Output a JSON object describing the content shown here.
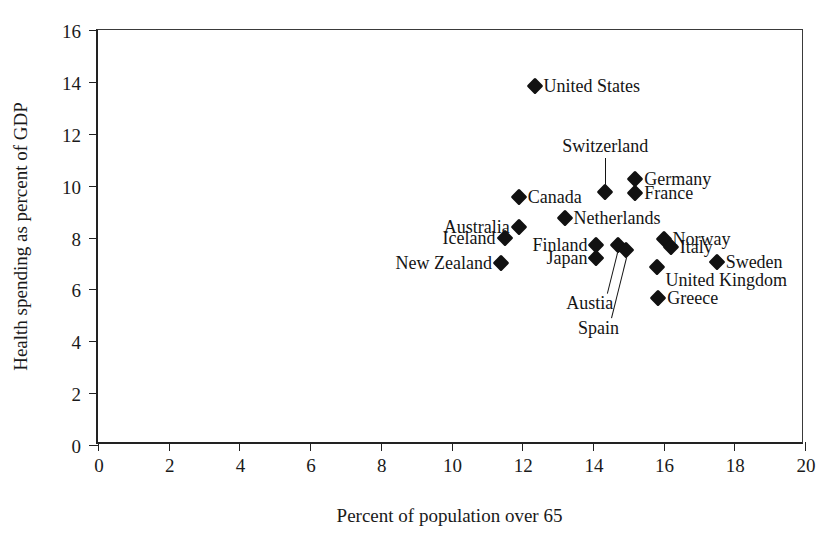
{
  "chart_data": {
    "type": "scatter",
    "title": "",
    "xlabel": "Percent of population over 65",
    "ylabel": "Health spending as percent of GDP",
    "xlim": [
      0,
      20
    ],
    "ylim": [
      0,
      16
    ],
    "xticks": [
      "0",
      "2",
      "4",
      "6",
      "8",
      "10",
      "12",
      "14",
      "16",
      "18",
      "20"
    ],
    "yticks": [
      "0",
      "2",
      "4",
      "6",
      "8",
      "10",
      "12",
      "14",
      "16"
    ],
    "grid": false,
    "legend": "none",
    "marker": "filled-diamond",
    "marker_color": "#111111",
    "points": [
      {
        "name": "United States",
        "x": 12.35,
        "y": 13.85,
        "label_pos": "right"
      },
      {
        "name": "Switzerland",
        "x": 14.35,
        "y": 9.75,
        "label_pos": "leader-up"
      },
      {
        "name": "Germany",
        "x": 15.2,
        "y": 10.25,
        "label_pos": "right"
      },
      {
        "name": "France",
        "x": 15.2,
        "y": 9.7,
        "label_pos": "right"
      },
      {
        "name": "Canada",
        "x": 11.9,
        "y": 9.55,
        "label_pos": "right"
      },
      {
        "name": "Australia",
        "x": 11.9,
        "y": 8.4,
        "label_pos": "left"
      },
      {
        "name": "Iceland",
        "x": 11.5,
        "y": 8.0,
        "label_pos": "left"
      },
      {
        "name": "New Zealand",
        "x": 11.4,
        "y": 7.0,
        "label_pos": "left"
      },
      {
        "name": "Netherlands",
        "x": 13.2,
        "y": 8.75,
        "label_pos": "right"
      },
      {
        "name": "Finland",
        "x": 14.1,
        "y": 7.7,
        "label_pos": "left"
      },
      {
        "name": "Japan",
        "x": 14.1,
        "y": 7.2,
        "label_pos": "left"
      },
      {
        "name": "Austia",
        "x": 14.7,
        "y": 7.7,
        "label_pos": "leader-down"
      },
      {
        "name": "Spain",
        "x": 14.95,
        "y": 7.5,
        "label_pos": "leader-down"
      },
      {
        "name": "Norway",
        "x": 16.0,
        "y": 7.95,
        "label_pos": "right"
      },
      {
        "name": "Italy",
        "x": 16.2,
        "y": 7.65,
        "label_pos": "right"
      },
      {
        "name": "Sweden",
        "x": 17.5,
        "y": 7.05,
        "label_pos": "right"
      },
      {
        "name": "United Kingdom",
        "x": 15.8,
        "y": 6.85,
        "label_pos": "below-right"
      },
      {
        "name": "Greece",
        "x": 15.85,
        "y": 5.65,
        "label_pos": "right"
      }
    ]
  }
}
